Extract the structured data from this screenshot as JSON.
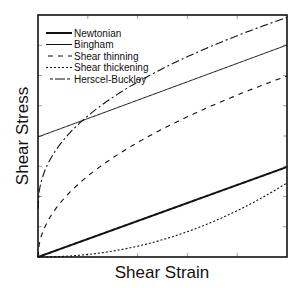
{
  "chart_data": {
    "type": "line",
    "title": "",
    "xlabel": "Shear Strain",
    "ylabel": "Shear Stress",
    "xlim": [
      0,
      1
    ],
    "ylim": [
      0,
      1
    ],
    "grid": false,
    "ticks": "unlabeled inward ticks",
    "legend_position": "upper-left",
    "series": [
      {
        "name": "Newtonian",
        "style": "solid-thick",
        "model": "linear",
        "x": [
          0,
          0.25,
          0.5,
          0.75,
          1.0
        ],
        "values": [
          0,
          0.093,
          0.186,
          0.279,
          0.372
        ]
      },
      {
        "name": "Bingham",
        "style": "solid-thin",
        "model": "linear-with-yield",
        "x": [
          0,
          0.25,
          0.5,
          0.75,
          1.0
        ],
        "values": [
          0.496,
          0.591,
          0.686,
          0.781,
          0.876
        ]
      },
      {
        "name": "Shear thinning",
        "style": "dashed",
        "model": "power-law n<1",
        "x": [
          0,
          0.1,
          0.25,
          0.5,
          0.75,
          1.0
        ],
        "values": [
          0,
          0.237,
          0.374,
          0.529,
          0.648,
          0.748
        ]
      },
      {
        "name": "Shear thickening",
        "style": "dotted",
        "model": "power-law n>1",
        "x": [
          0,
          0.25,
          0.5,
          0.75,
          1.0
        ],
        "values": [
          0,
          0.019,
          0.077,
          0.172,
          0.306
        ]
      },
      {
        "name": "Herscel-Buckley",
        "style": "dash-dot",
        "model": "yield + power-law n<1",
        "x": [
          0,
          0.1,
          0.169,
          0.25,
          0.5,
          0.75,
          1.0
        ],
        "values": [
          0.2,
          0.478,
          0.554,
          0.621,
          0.772,
          0.888,
          0.99
        ]
      }
    ]
  },
  "legend": {
    "items": [
      {
        "label": "Newtonian"
      },
      {
        "label": "Bingham"
      },
      {
        "label": "Shear thinning"
      },
      {
        "label": "Shear thickening"
      },
      {
        "label": "Herscel-Buckley"
      }
    ]
  },
  "axes": {
    "x_label": "Shear Strain",
    "y_label": "Shear Stress"
  }
}
